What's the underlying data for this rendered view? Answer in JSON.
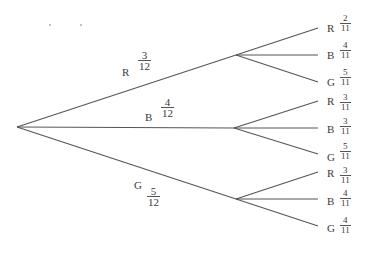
{
  "diagram": {
    "type": "probability-tree",
    "first_stage": [
      {
        "color": "R",
        "numerator": "3",
        "denominator": "12"
      },
      {
        "color": "B",
        "numerator": "4",
        "denominator": "12"
      },
      {
        "color": "G",
        "numerator": "5",
        "denominator": "12"
      }
    ],
    "second_stage": [
      {
        "parent": "R",
        "branches": [
          {
            "color": "R",
            "numerator": "2",
            "denominator": "11"
          },
          {
            "color": "B",
            "numerator": "4",
            "denominator": "11"
          },
          {
            "color": "G",
            "numerator": "5",
            "denominator": "11"
          }
        ]
      },
      {
        "parent": "B",
        "branches": [
          {
            "color": "R",
            "numerator": "3",
            "denominator": "11"
          },
          {
            "color": "B",
            "numerator": "3",
            "denominator": "11"
          },
          {
            "color": "G",
            "numerator": "5",
            "denominator": "11"
          }
        ]
      },
      {
        "parent": "G",
        "branches": [
          {
            "color": "R",
            "numerator": "3",
            "denominator": "11"
          },
          {
            "color": "B",
            "numerator": "4",
            "denominator": "11"
          },
          {
            "color": "G",
            "numerator": "4",
            "denominator": "11"
          }
        ]
      }
    ],
    "line_color": "#555555"
  }
}
